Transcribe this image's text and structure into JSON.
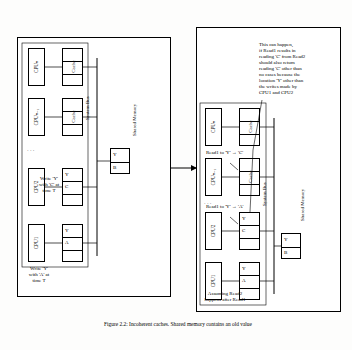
{
  "figure": {
    "caption_line1": "Figure 2.2: Incoherent caches. Shared memory contains an",
    "caption_line2": "old value"
  },
  "left_panel": {
    "title": "left-system-snapshot",
    "bus_label": "System Bus",
    "memory_label": "Shared Memory",
    "memory_cells": [
      "Y",
      "B"
    ],
    "cpus": [
      {
        "name": "CPUₙ",
        "cache_label": "Cache",
        "cache_cells": [
          "",
          "",
          ""
        ]
      },
      {
        "name": "CPUₙ₋₁",
        "cache_label": "Cache",
        "cache_cells": [
          "",
          "",
          ""
        ]
      },
      {
        "name": "CPU2",
        "cache_label": "Cache",
        "cache_cells": [
          "Y",
          "C",
          ""
        ],
        "note_line1": "Write 'Y'",
        "note_line2": "with 'C' at",
        "note_line3": "time T"
      },
      {
        "name": "CPU1",
        "cache_label": "Cache",
        "cache_cells": [
          "Y",
          "A",
          ""
        ],
        "note_line1": "Write 'Y'",
        "note_line2": "with 'A' at",
        "note_line3": "time T"
      }
    ],
    "ellipsis": "·  ·  ·"
  },
  "right_panel": {
    "title": "right-system-snapshot",
    "bus_label": "System Bus",
    "memory_label": "Shared Memory",
    "memory_cells": [
      "Y",
      "B"
    ],
    "cpus": [
      {
        "name": "CPUₙ",
        "cache_label": "Cache",
        "cache_cells": [
          "",
          "",
          ""
        ]
      },
      {
        "name": "CPUₙ₋₁",
        "cache_label": "Cache",
        "cache_cells": [
          "",
          "",
          ""
        ],
        "note": "Read1 to 'Y' → 'C'"
      },
      {
        "name": "CPU2",
        "cache_label": "Cache",
        "cache_cells": [
          "Y",
          "C",
          ""
        ],
        "note": "Read1 to 'Y' → 'A'"
      },
      {
        "name": "CPU1",
        "cache_label": "Cache",
        "cache_cells": [
          "Y",
          "A",
          ""
        ]
      }
    ],
    "ellipsis": "·  ·  ·",
    "callout_lines": [
      "This can happen,",
      "if Read1 results in",
      "reading 'C' from Read2",
      "should also return",
      "reading 'C' other than",
      "no cases because the",
      "location 'Y' other than",
      "the writes made by",
      "CPU1 and CPU2"
    ],
    "footer_line1": "Assuming Read2",
    "footer_line2": "happens after Read1"
  }
}
